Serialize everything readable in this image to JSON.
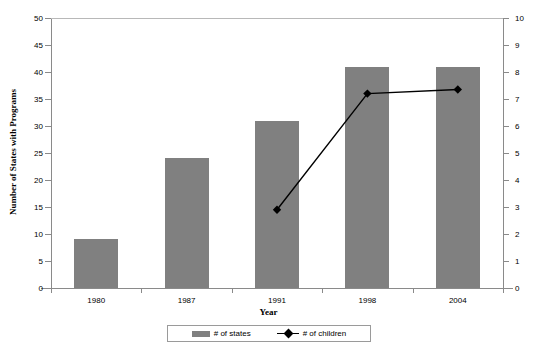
{
  "chart_data": {
    "type": "bar",
    "title": "",
    "xlabel": "Year",
    "ylabel": "Number of States with Programs",
    "y2label": "",
    "categories": [
      "1980",
      "1987",
      "1991",
      "1998",
      "2004"
    ],
    "ylim": [
      0,
      50
    ],
    "y2lim": [
      0,
      10
    ],
    "yticks": [
      0,
      5,
      10,
      15,
      20,
      25,
      30,
      35,
      40,
      45,
      50
    ],
    "y2ticks": [
      0,
      1,
      2,
      3,
      4,
      5,
      6,
      7,
      8,
      9,
      10
    ],
    "grid": false,
    "legend_position": "bottom",
    "series": [
      {
        "name": "# of states",
        "type": "bar",
        "axis": "left",
        "color": "#808080",
        "values": [
          9,
          24,
          31,
          41,
          41
        ]
      },
      {
        "name": "# of children",
        "type": "line",
        "axis": "right",
        "color": "#000000",
        "marker": "diamond",
        "values": [
          null,
          null,
          2.9,
          7.2,
          7.35
        ]
      }
    ]
  },
  "axes": {
    "y_left": {
      "title": "Number of States with Programs",
      "ticklabels": [
        "50",
        "45",
        "40",
        "35",
        "30",
        "25",
        "20",
        "15",
        "10",
        "5",
        "0"
      ]
    },
    "y_right": {
      "title": "",
      "ticklabels": [
        "10",
        "9",
        "8",
        "7",
        "6",
        "5",
        "4",
        "3",
        "2",
        "1",
        "0"
      ]
    },
    "x": {
      "title": "Year",
      "ticklabels": [
        "1980",
        "1987",
        "1991",
        "1998",
        "2004"
      ]
    }
  },
  "legend": {
    "entries": [
      {
        "label": "# of states",
        "marker": "bar-swatch",
        "color": "#808080"
      },
      {
        "label": "# of children",
        "marker": "line-diamond",
        "color": "#000000"
      }
    ]
  },
  "colors": {
    "bar_fill": "#808080",
    "line_stroke": "#000000",
    "axis_line": "#8a8a8a",
    "gridline": "#b8b8b8",
    "background": "#ffffff",
    "text": "#000000"
  }
}
